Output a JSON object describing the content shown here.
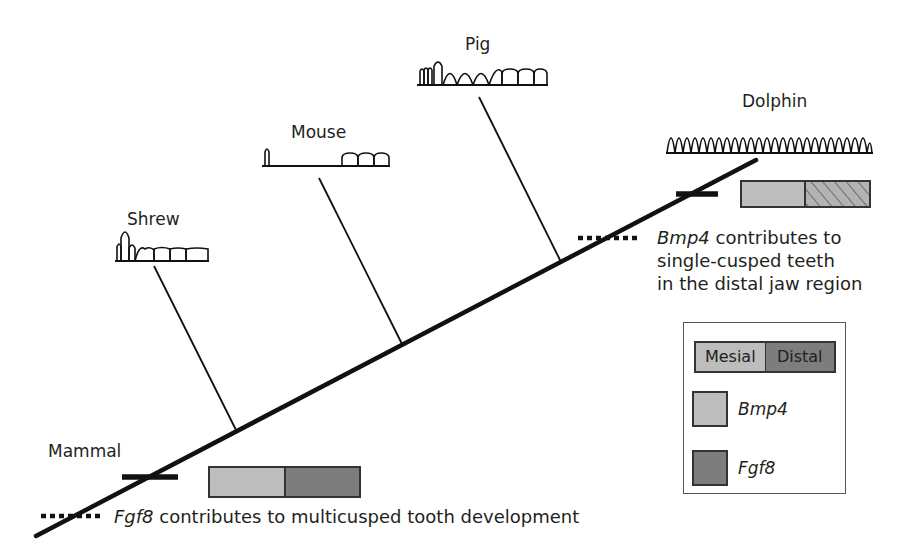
{
  "figure": {
    "root_label": "Mammal",
    "species": [
      {
        "name": "Shrew",
        "dentition": "one tall single cusp, smaller cusps, then multicusped molars"
      },
      {
        "name": "Mouse",
        "dentition": "single incisor, gap (diastema), three molars"
      },
      {
        "name": "Pig",
        "dentition": "incisors, canine, premolars with cusps, molars"
      },
      {
        "name": "Dolphin",
        "dentition": "row of uniform single-cusped teeth"
      }
    ],
    "notes": {
      "bmp4": {
        "gene": "Bmp4",
        "line1_rest": " contributes to",
        "line2": "single-cusped teeth",
        "line3": "in the distal jaw region"
      },
      "fgf8": {
        "gene": "Fgf8",
        "rest": " contributes to multicusped tooth development"
      }
    },
    "expression_bars": {
      "mammal": {
        "mesial": "Bmp4",
        "distal": "Fgf8"
      },
      "dolphin": {
        "mesial": "Bmp4",
        "distal": "Bmp4 (hatched)"
      }
    },
    "legend": {
      "mesial_label": "Mesial",
      "distal_label": "Distal",
      "items": [
        {
          "label": "Bmp4",
          "color": "#bdbdbd"
        },
        {
          "label": "Fgf8",
          "color": "#7d7d7d"
        }
      ]
    },
    "colors": {
      "line": "#111111",
      "bmp4": "#bdbdbd",
      "fgf8": "#7d7d7d",
      "text": "#231f20"
    }
  }
}
